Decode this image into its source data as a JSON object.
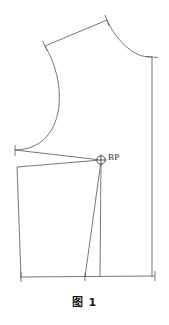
{
  "figure": {
    "caption": "图 1",
    "title": "图 1",
    "type": "garment-pattern-draft",
    "line_color": "#555555",
    "background_color": "#ffffff",
    "text_color": "#1a1a1a",
    "width_px": 169,
    "height_px": 325
  },
  "annotations": {
    "bust_point_label": "BP",
    "bust_point_marker": "circle-crosshair",
    "bust_point_x": 101,
    "bust_point_y": 160
  },
  "icons": {
    "bust-point-icon": "circle-crosshair",
    "tick-icon": "short-perpendicular-stroke"
  },
  "geometry": {
    "center_front_line": {
      "x": 152,
      "y_top": 57,
      "y_bottom": 277
    },
    "hem_line": {
      "x_left": 20,
      "x_right": 155,
      "y_left": 277,
      "y_right": 276
    },
    "shoulder_line": {
      "x1": 45,
      "y1": 46,
      "x2": 107,
      "y2": 20
    },
    "neckline_curve": {
      "from_x": 107,
      "from_y": 20,
      "to_x": 152,
      "to_y": 57
    },
    "armhole_curve": {
      "from_x": 45,
      "from_y": 46,
      "to_x": 15,
      "to_y": 150
    },
    "side_seam": {
      "x_top": 17,
      "y_top": 167,
      "x_bottom": 21,
      "y_bottom": 277
    },
    "waist_dart_left": {
      "x": 85,
      "y": 277
    },
    "waist_dart_right": {
      "x": 100,
      "y": 276
    }
  },
  "tick_marks": [
    {
      "name": "shoulder-tip-tick",
      "x": 45,
      "y": 46
    },
    {
      "name": "neck-shoulder-tick",
      "x": 107,
      "y": 20
    },
    {
      "name": "underarm-tick",
      "x": 15,
      "y": 150
    },
    {
      "name": "center-front-top-tick",
      "x": 152,
      "y": 57
    },
    {
      "name": "hem-left-tick",
      "x": 21,
      "y": 277
    },
    {
      "name": "hem-right-tick",
      "x": 155,
      "y": 276
    },
    {
      "name": "hem-dart-tick",
      "x": 85,
      "y": 277
    }
  ]
}
